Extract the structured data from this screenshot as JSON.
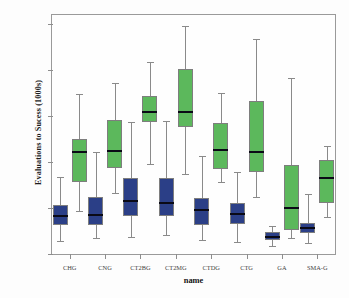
{
  "chart_data": {
    "type": "box",
    "title": "",
    "xlabel": "name",
    "ylabel": "Evaluations to Sucess (1000s)",
    "ylim": [
      0,
      520
    ],
    "yticks": [
      0,
      100,
      200,
      300,
      400,
      500
    ],
    "ytick_labels": [
      "0",
      "100",
      "200",
      "300",
      "400",
      "500"
    ],
    "grid": false,
    "legend": "none",
    "categories": [
      "CHG",
      "CNG",
      "CT2BG",
      "CT2MG",
      "CTDG",
      "CTG",
      "GA",
      "SMA-G"
    ],
    "series": [
      {
        "name": "blue",
        "color": "#2b3f87",
        "boxes": [
          {
            "category": "CHG",
            "whisker_low": 28,
            "q1": 62,
            "median": 82,
            "q3": 107,
            "whisker_high": 168
          },
          {
            "category": "CNG",
            "whisker_low": 35,
            "q1": 62,
            "median": 84,
            "q3": 123,
            "whisker_high": 222
          },
          {
            "category": "CT2BG",
            "whisker_low": 38,
            "q1": 83,
            "median": 115,
            "q3": 165,
            "whisker_high": 288
          },
          {
            "category": "CT2MG",
            "whisker_low": 42,
            "q1": 83,
            "median": 110,
            "q3": 166,
            "whisker_high": 290
          },
          {
            "category": "CTDG",
            "whisker_low": 30,
            "q1": 64,
            "median": 95,
            "q3": 122,
            "whisker_high": 214
          },
          {
            "category": "CTG",
            "whisker_low": 26,
            "q1": 66,
            "median": 87,
            "q3": 112,
            "whisker_high": 178
          },
          {
            "category": "GA",
            "whisker_low": 18,
            "q1": 30,
            "median": 37,
            "q3": 48,
            "whisker_high": 61
          },
          {
            "category": "SMA-G",
            "whisker_low": 25,
            "q1": 45,
            "median": 57,
            "q3": 68,
            "whisker_high": 130
          }
        ]
      },
      {
        "name": "green",
        "color": "#5cb85c",
        "boxes": [
          {
            "category": "CHG",
            "whisker_low": 93,
            "q1": 156,
            "median": 222,
            "q3": 250,
            "whisker_high": 348
          },
          {
            "category": "CNG",
            "whisker_low": 132,
            "q1": 188,
            "median": 224,
            "q3": 292,
            "whisker_high": 372
          },
          {
            "category": "CT2BG",
            "whisker_low": 196,
            "q1": 288,
            "median": 310,
            "q3": 344,
            "whisker_high": 417
          },
          {
            "category": "CT2MG",
            "whisker_low": 173,
            "q1": 276,
            "median": 308,
            "q3": 402,
            "whisker_high": 495
          },
          {
            "category": "CTDG",
            "whisker_low": 157,
            "q1": 186,
            "median": 227,
            "q3": 284,
            "whisker_high": 350
          },
          {
            "category": "CTG",
            "whisker_low": 124,
            "q1": 178,
            "median": 222,
            "q3": 333,
            "whisker_high": 468
          },
          {
            "category": "GA",
            "whisker_low": 35,
            "q1": 52,
            "median": 101,
            "q3": 194,
            "whisker_high": 382
          },
          {
            "category": "SMA-G",
            "whisker_low": 81,
            "q1": 112,
            "median": 166,
            "q3": 204,
            "whisker_high": 235
          }
        ]
      }
    ]
  }
}
